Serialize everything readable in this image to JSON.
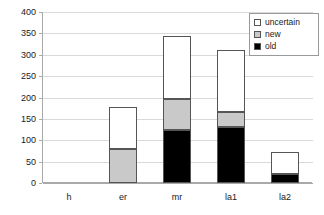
{
  "chart_data": {
    "type": "bar",
    "subtype": "stacked-bar",
    "title": "",
    "xlabel": "",
    "ylabel": "",
    "categories": [
      "h",
      "er",
      "mr",
      "la1",
      "la2"
    ],
    "series": [
      {
        "name": "old",
        "color": "#000000",
        "values": [
          0,
          0,
          124,
          130,
          21
        ]
      },
      {
        "name": "new",
        "color": "#c9c9c9",
        "values": [
          0,
          80,
          72,
          37,
          0
        ]
      },
      {
        "name": "uncertain",
        "color": "#ffffff",
        "values": [
          0,
          98,
          148,
          144,
          52
        ]
      }
    ],
    "totals": [
      0,
      178,
      344,
      311,
      73
    ],
    "ylim": [
      0,
      400
    ],
    "yticks": [
      0,
      50,
      100,
      150,
      200,
      250,
      300,
      350,
      400
    ],
    "ytick_labels": [
      "0",
      "50",
      "100",
      "150",
      "200",
      "250",
      "300",
      "350",
      "400"
    ],
    "grid": "horizontal",
    "legend_position": "top-right",
    "legend_order": [
      "uncertain",
      "new",
      "old"
    ]
  },
  "legend": {
    "items": [
      {
        "label": "uncertain",
        "swatch": "white-square-icon"
      },
      {
        "label": "new",
        "swatch": "gray-square-icon"
      },
      {
        "label": "old",
        "swatch": "black-square-icon"
      }
    ]
  },
  "colors": {
    "old": "#000000",
    "new": "#c9c9c9",
    "uncertain": "#ffffff",
    "gridline": "#d9d9d9",
    "axis": "#a9a9a9",
    "bar_outline": "#555555",
    "text": "#1a1a1a",
    "background": "#ffffff"
  }
}
